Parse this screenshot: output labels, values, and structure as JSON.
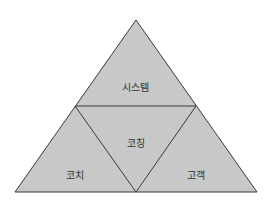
{
  "diagram": {
    "type": "triangle-quadrants",
    "colors": {
      "fill": "#c8c8c8",
      "stroke": "#3a3a3a",
      "background": "#ffffff",
      "text": "#333333"
    },
    "sections": [
      {
        "id": "top",
        "label": "시스템"
      },
      {
        "id": "center",
        "label": "코칭"
      },
      {
        "id": "bottom-left",
        "label": "코치"
      },
      {
        "id": "bottom-right",
        "label": "고객"
      }
    ]
  }
}
